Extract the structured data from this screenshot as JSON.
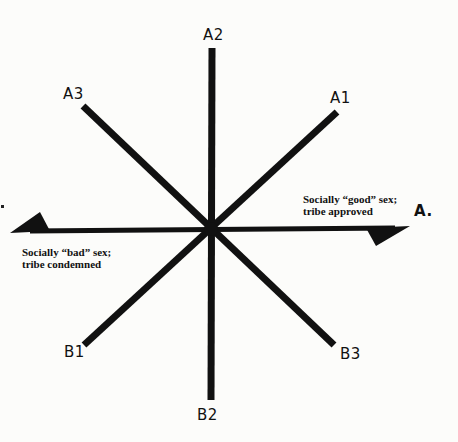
{
  "diagram": {
    "type": "radial-axes",
    "center": {
      "x": 211,
      "y": 229
    },
    "colors": {
      "line": "#111111",
      "background": "#fcfcfa",
      "text": "#111111"
    },
    "axes": [
      {
        "id": "A2",
        "label": "A2",
        "end": {
          "x": 212,
          "y": 48
        }
      },
      {
        "id": "B2",
        "label": "B2",
        "end": {
          "x": 211,
          "y": 400
        }
      },
      {
        "id": "A1",
        "label": "A1",
        "end": {
          "x": 337,
          "y": 112
        }
      },
      {
        "id": "B1",
        "label": "B1",
        "end": {
          "x": 84,
          "y": 345
        }
      },
      {
        "id": "A3",
        "label": "A3",
        "end": {
          "x": 83,
          "y": 106
        }
      },
      {
        "id": "B3",
        "label": "B3",
        "end": {
          "x": 334,
          "y": 345
        }
      }
    ],
    "horizontal_axis": {
      "label_right": "A.",
      "left_end": {
        "x": 10,
        "y": 232
      },
      "right_end": {
        "x": 410,
        "y": 227
      }
    },
    "captions": {
      "good": {
        "line1": "Socially “good” sex;",
        "line2": "tribe approved"
      },
      "bad": {
        "line1": "Socially “bad” sex;",
        "line2": "tribe condemned"
      }
    },
    "labels": {
      "a1": "A1",
      "a2": "A2",
      "a3": "A3",
      "b1": "B1",
      "b2": "B2",
      "b3": "B3",
      "a_dot": "A."
    }
  }
}
